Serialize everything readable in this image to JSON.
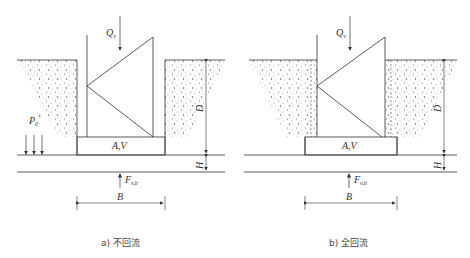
{
  "figures": [
    {
      "id": "a",
      "caption": "a) 不回流",
      "labels": {
        "Q": "Q",
        "Q_sub": "v",
        "P": "P",
        "P_sub": "0",
        "P_prime": "'",
        "AV": "A,V",
        "F": "F",
        "F_sub": "v,b",
        "B": "B",
        "D": "D",
        "H": "H"
      }
    },
    {
      "id": "b",
      "caption": "b) 全回流",
      "labels": {
        "Q": "Q",
        "Q_sub": "v",
        "AV": "A,V",
        "F": "F",
        "F_sub": "v,b",
        "B": "B",
        "D": "D",
        "H": "H"
      }
    }
  ],
  "colors": {
    "line": "#333333",
    "soil_dot": "#555555",
    "text": "#333333"
  }
}
